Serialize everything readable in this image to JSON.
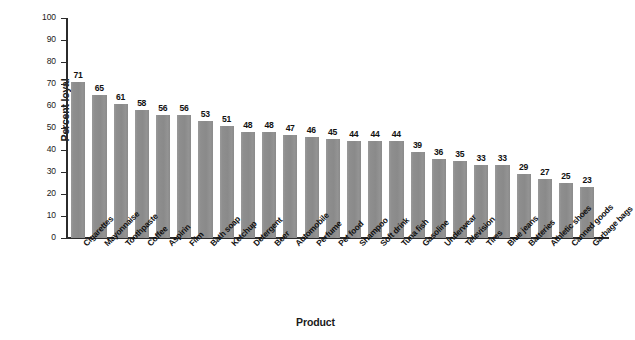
{
  "chart_data": {
    "type": "bar",
    "title": "",
    "xlabel": "Product",
    "ylabel": "Percent loyal",
    "ylim": [
      0,
      100
    ],
    "ytick_step": 10,
    "yticks": [
      100,
      90,
      80,
      70,
      60,
      50,
      40,
      30,
      20,
      10,
      0
    ],
    "grid": false,
    "legend": null,
    "bar_color": "#8c8c8c",
    "axis_color": "#2b2b2b",
    "value_labels_shown": true,
    "categories": [
      "Cigarettes",
      "Mayonnaise",
      "Toothpaste",
      "Coffee",
      "Aspirin",
      "Film",
      "Bath soap",
      "Ketchup",
      "Detergent",
      "Beer",
      "Automobile",
      "Perfume",
      "Pet food",
      "Shampoo",
      "Soft drink",
      "Tuna fish",
      "Gasoline",
      "Underwear",
      "Television",
      "Tires",
      "Blue jeans",
      "Batteries",
      "Athletic shoes",
      "Canned goods",
      "Garbage bags"
    ],
    "values": [
      71,
      65,
      61,
      58,
      56,
      56,
      53,
      51,
      48,
      48,
      47,
      46,
      45,
      44,
      44,
      44,
      39,
      36,
      35,
      33,
      33,
      29,
      27,
      25,
      23
    ]
  }
}
